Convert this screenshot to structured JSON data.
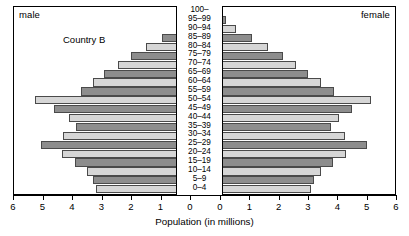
{
  "chart_data": {
    "type": "bar",
    "subtype": "population-pyramid",
    "title": "Country B",
    "xlabel": "Population (in millions)",
    "ylabel": "",
    "left_series_name": "male",
    "right_series_name": "female",
    "xlim": [
      0,
      6
    ],
    "xticks": [
      6,
      5,
      4,
      3,
      2,
      1,
      0,
      0,
      1,
      2,
      3,
      4,
      5,
      6
    ],
    "grid": false,
    "legend_position": "corners",
    "bar_color_dark": "#8d8d8d",
    "bar_color_light": "#d6d6d6",
    "categories": [
      "100–",
      "95–99",
      "90–94",
      "85–89",
      "80–84",
      "75–79",
      "70–74",
      "65–69",
      "60–64",
      "55–59",
      "50–54",
      "45–49",
      "40–44",
      "35–39",
      "30–34",
      "25–29",
      "20–24",
      "15–19",
      "10–14",
      "5–9",
      "0–4"
    ],
    "series": [
      {
        "name": "male",
        "side": "left",
        "values": [
          0.0,
          0.15,
          0.45,
          0.95,
          1.5,
          2.0,
          2.45,
          2.9,
          3.3,
          3.7,
          5.25,
          4.6,
          4.1,
          3.85,
          4.3,
          5.05,
          4.35,
          3.9,
          3.5,
          3.3,
          3.2
        ]
      },
      {
        "name": "female",
        "side": "right",
        "values": [
          0.0,
          0.2,
          0.55,
          1.1,
          1.65,
          2.15,
          2.6,
          3.0,
          3.45,
          3.9,
          5.15,
          4.5,
          4.05,
          3.8,
          4.25,
          5.0,
          4.3,
          3.85,
          3.45,
          3.2,
          3.1
        ]
      }
    ]
  },
  "labels": {
    "male": "male",
    "female": "female",
    "country": "Country B",
    "axis_title": "Population (in millions)"
  }
}
